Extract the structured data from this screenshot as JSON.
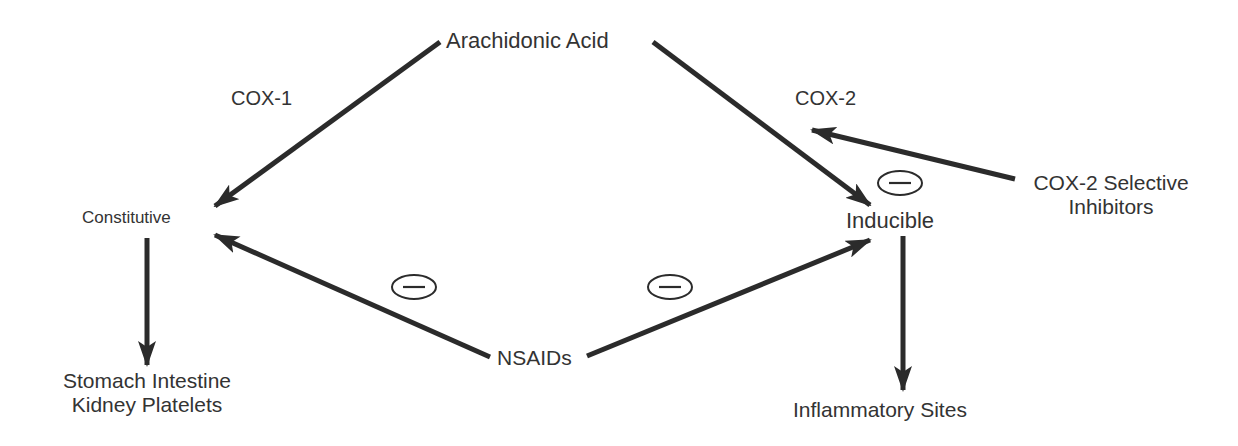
{
  "nodes": {
    "arachidonic_acid": "Arachidonic Acid",
    "cox1": "COX-1",
    "cox2": "COX-2",
    "constitutive": "Constitutive",
    "inducible": "Inducible",
    "cox2_inhibitors_line1": "COX-2 Selective",
    "cox2_inhibitors_line2": "Inhibitors",
    "nsaids": "NSAIDs",
    "constitutive_targets_line1": "Stomach Intestine",
    "constitutive_targets_line2": "Kidney Platelets",
    "inducible_targets": "Inflammatory Sites"
  },
  "inhibition_symbol": "−",
  "colors": {
    "stroke": "#2b2b2b",
    "text": "#333333",
    "background": "#ffffff"
  }
}
